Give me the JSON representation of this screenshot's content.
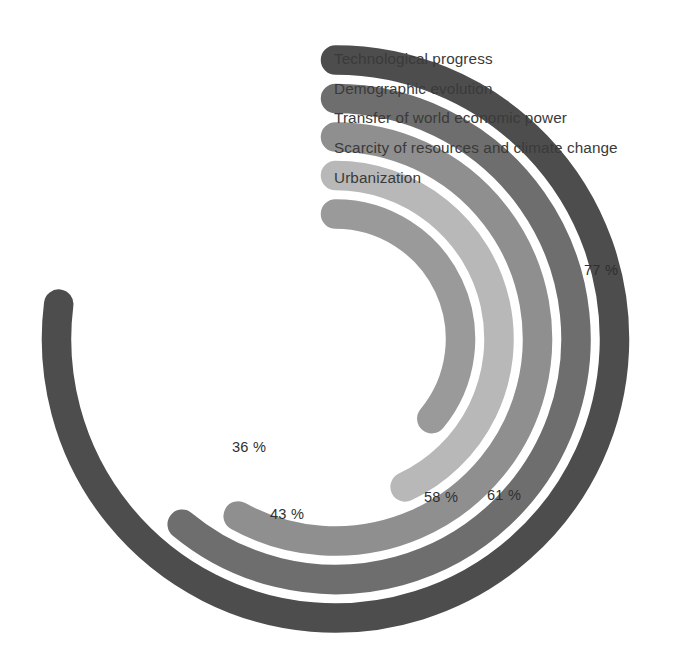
{
  "chart_data": {
    "type": "bar",
    "subtype": "radial-bar",
    "title": "",
    "xlabel": "",
    "ylabel": "",
    "categories": [
      "Technological progress",
      "Demographic evolution",
      "Transfer of world economic power",
      "Scarcity of resources and climate change",
      "Urbanization"
    ],
    "values": [
      77,
      61,
      58,
      43,
      36
    ],
    "value_labels": [
      "77 %",
      "61 %",
      "58 %",
      "43 %",
      "36 %"
    ],
    "unit": "%",
    "ylim": [
      0,
      100
    ],
    "grid": false,
    "legend_position": "inside-top-right",
    "start_angle_deg": 0,
    "direction": "clockwise",
    "colors": [
      "#4d4d4d",
      "#6e6e6e",
      "#8f8f8f",
      "#b8b8b8",
      "#9a9a9a"
    ],
    "series": [
      {
        "name": "Technological progress",
        "value": 77,
        "label": "77 %",
        "color": "#4d4d4d",
        "ring": 1
      },
      {
        "name": "Demographic evolution",
        "value": 61,
        "label": "61 %",
        "color": "#6e6e6e",
        "ring": 2
      },
      {
        "name": "Transfer of world economic power",
        "value": 58,
        "label": "58 %",
        "color": "#8f8f8f",
        "ring": 3
      },
      {
        "name": "Scarcity of resources and climate change",
        "value": 43,
        "label": "43 %",
        "color": "#b8b8b8",
        "ring": 4
      },
      {
        "name": "Urbanization",
        "value": 36,
        "label": "36 %",
        "color": "#9a9a9a",
        "ring": 5
      }
    ]
  },
  "legend": {
    "items": [
      {
        "label": "Technological progress",
        "color": "#4d4d4d"
      },
      {
        "label": "Demographic evolution",
        "color": "#6e6e6e"
      },
      {
        "label": "Transfer of world economic power",
        "color": "#8f8f8f"
      },
      {
        "label": "Scarcity of resources and climate change",
        "color": "#b8b8b8"
      },
      {
        "label": "Urbanization",
        "color": "#9a9a9a"
      }
    ]
  },
  "value_labels": [
    {
      "text": "77 %",
      "x": 584,
      "y": 262,
      "for": "Technological progress"
    },
    {
      "text": "61 %",
      "x": 487,
      "y": 487,
      "for": "Demographic evolution"
    },
    {
      "text": "58 %",
      "x": 424,
      "y": 489,
      "for": "Transfer of world economic power"
    },
    {
      "text": "43 %",
      "x": 270,
      "y": 506,
      "for": "Scarcity of resources and climate change"
    },
    {
      "text": "36 %",
      "x": 232,
      "y": 439,
      "for": "Urbanization"
    }
  ],
  "background": "#ffffff",
  "top_artifact_text": ""
}
